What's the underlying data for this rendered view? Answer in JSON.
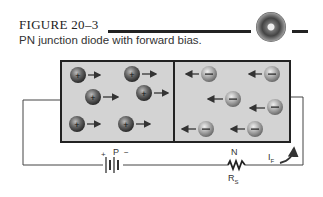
{
  "figure": {
    "label": "FIGURE 20–3",
    "caption": "PN junction diode with forward bias.",
    "icon": "cd-disc-icon"
  },
  "diagram": {
    "p_region": {
      "label": "P",
      "carriers": "holes",
      "carrier_symbol": "+",
      "count": 6,
      "arrow_direction": "right"
    },
    "n_region": {
      "label": "N",
      "carriers": "electrons",
      "carrier_symbol": "−",
      "count": 7,
      "arrow_direction": "left"
    },
    "battery": {
      "plus_label": "+",
      "minus_label": "−"
    },
    "resistor": {
      "label": "R",
      "subscript": "S"
    },
    "current": {
      "label": "I",
      "subscript": "F"
    },
    "colors": {
      "region_fill": "#d3d3d3",
      "border": "#222222",
      "hole": "#555555",
      "electron": "#9a9a9a"
    }
  }
}
